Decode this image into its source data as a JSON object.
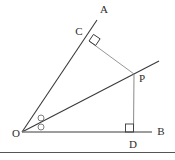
{
  "figure": {
    "type": "geometry-diagram",
    "title": "",
    "width": 175,
    "height": 160,
    "background_color": "#ffffff",
    "colors": {
      "ray_dark": "#3a3a3a",
      "segment_gray": "#8a8a8a",
      "axis_gray": "#7d7d7d",
      "label_text": "#2b2b2b",
      "rule": "#555555"
    },
    "labels": {
      "A": "A",
      "B": "B",
      "C": "C",
      "D": "D",
      "O": "O",
      "P": "P"
    },
    "points": {
      "O": {
        "x": 22,
        "y": 132
      },
      "A": {
        "x": 97,
        "y": 20
      },
      "B": {
        "x": 152,
        "y": 132
      },
      "C": {
        "x": 89,
        "y": 41
      },
      "D": {
        "x": 133,
        "y": 132
      },
      "P": {
        "x": 134,
        "y": 74
      }
    },
    "label_positions": {
      "A": {
        "x": 100,
        "y": 13
      },
      "B": {
        "x": 161,
        "y": 133
      },
      "C": {
        "x": 79,
        "y": 35
      },
      "D": {
        "x": 133,
        "y": 148
      },
      "O": {
        "x": 12,
        "y": 137
      },
      "P": {
        "x": 139,
        "y": 82
      }
    },
    "segments": [
      {
        "name": "ray-OA",
        "from": "O",
        "to": "A",
        "style": "dark"
      },
      {
        "name": "ray-OP-extended",
        "from": "O",
        "to": "ray_tip",
        "style": "dark"
      },
      {
        "name": "segment-CP",
        "from": "C",
        "to": "P",
        "style": "gray"
      },
      {
        "name": "segment-PD",
        "from": "P",
        "to": "D",
        "style": "gray"
      },
      {
        "name": "segment-OB",
        "from": "O",
        "to": "B",
        "style": "gray"
      }
    ],
    "ray_tip": {
      "x": 159,
      "y": 61
    },
    "marks": {
      "right_angle_at_C": {
        "x": 89,
        "y": 41,
        "rotated": true,
        "size": 8
      },
      "right_angle_at_D": {
        "x": 133,
        "y": 132,
        "rotated": false,
        "size": 8
      },
      "equal_angle_circles": [
        {
          "cx": 41,
          "cy": 118,
          "r": 3
        },
        {
          "cx": 41,
          "cy": 127,
          "r": 3
        }
      ]
    },
    "bottom_rule": {
      "y": 152,
      "x1": 0,
      "x2": 175
    }
  }
}
